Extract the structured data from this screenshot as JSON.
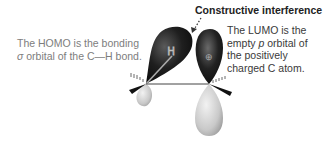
{
  "title": "Constructive interference",
  "homo_label": {
    "line1": "The HOMO is the bonding",
    "line2_prefix": "σ",
    "line2_mid": " orbital of the C",
    "line2_bond": "—",
    "line2_suffix": "H bond."
  },
  "lumo_label": {
    "line1": "The LUMO is the",
    "line2_prefix": "empty ",
    "line2_italic": "p",
    "line2_suffix": " orbital of",
    "line3": "the positively",
    "line4": "charged C atom."
  },
  "atom_labels": {
    "hydrogen": "H",
    "carbon_charge": "⊕"
  },
  "colors": {
    "dark_lobe": "#1a1a1a",
    "light_lobe": "#c8c8c8",
    "homo_text": "#7d7d7d",
    "lumo_text": "#3a3a3a",
    "title_text": "#222222"
  }
}
